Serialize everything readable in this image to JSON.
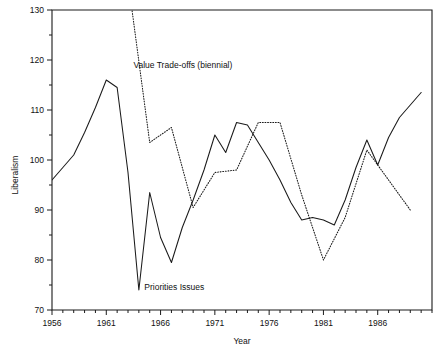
{
  "chart_data": {
    "type": "line",
    "title": "",
    "xlabel": "Year",
    "ylabel": "Liberalism",
    "xlim": [
      1956,
      1991
    ],
    "ylim": [
      70,
      130
    ],
    "grid": false,
    "legend_position": "inline-annotations",
    "y_ticks_major": [
      70,
      80,
      90,
      100,
      110,
      120,
      130
    ],
    "y_ticks_minor": [
      75,
      85,
      95,
      105,
      115,
      125
    ],
    "x_ticks_major": [
      1956,
      1961,
      1966,
      1971,
      1976,
      1981,
      1986
    ],
    "x_tick_interval": 1,
    "annotations": [
      {
        "text": "Value Trade-offs (biennial)",
        "x": 1963.5,
        "y": 118.5
      },
      {
        "text": "Priorities Issues",
        "x": 1964.5,
        "y": 74.0
      }
    ],
    "series": [
      {
        "name": "Priorities Issues",
        "style": "solid",
        "x": [
          1956,
          1957,
          1958,
          1959,
          1960,
          1961,
          1962,
          1963,
          1964,
          1965,
          1966,
          1967,
          1968,
          1969,
          1970,
          1971,
          1972,
          1973,
          1974,
          1975,
          1976,
          1977,
          1978,
          1979,
          1980,
          1981,
          1982,
          1983,
          1984,
          1985,
          1986,
          1987,
          1988,
          1989,
          1990
        ],
        "values": [
          96.0,
          98.5,
          101.0,
          105.5,
          110.5,
          116.0,
          114.5,
          97.5,
          74.0,
          93.5,
          84.5,
          79.5,
          86.5,
          92.0,
          98.0,
          105.0,
          101.5,
          107.5,
          107.0,
          103.5,
          100.0,
          96.0,
          91.5,
          88.0,
          88.5,
          88.0,
          87.0,
          92.0,
          98.5,
          104.0,
          99.0,
          104.5,
          108.5,
          111.0,
          113.5
        ]
      },
      {
        "name": "Value Trade-offs (biennial)",
        "style": "dotted",
        "x": [
          1963,
          1965,
          1967,
          1969,
          1971,
          1973,
          1975,
          1977,
          1979,
          1981,
          1983,
          1985,
          1987,
          1989
        ],
        "values": [
          136.0,
          103.5,
          106.5,
          90.5,
          97.5,
          98.0,
          107.5,
          107.5,
          93.0,
          80.0,
          88.5,
          102.0,
          96.0,
          90.0
        ],
        "clipped_above": 130
      }
    ]
  },
  "axes": {
    "y_label_text": "Liberalism",
    "x_label_text": "Year",
    "y_tick_labels": [
      "70",
      "80",
      "90",
      "100",
      "110",
      "120",
      "130"
    ],
    "x_tick_labels": [
      "1956",
      "1961",
      "1966",
      "1971",
      "1976",
      "1981",
      "1986"
    ]
  },
  "annotation_labels": {
    "value_tradeoffs": "Value Trade-offs (biennial)",
    "priorities_issues": "Priorities Issues"
  },
  "colors": {
    "line": "#1a1a1a",
    "axis": "#1a1a1a",
    "background": "#ffffff",
    "text": "#111111"
  }
}
